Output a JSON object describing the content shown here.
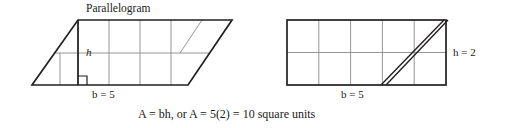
{
  "figure": {
    "title": "Parallelogram",
    "type": "geometry-diagram",
    "caption": "A = bh, or A = 5(2) = 10 square units",
    "colors": {
      "outline": "#231f20",
      "grid": "#808080",
      "background": "#ffffff",
      "text": "#1a1a1a"
    },
    "left_shape": {
      "name": "parallelogram",
      "base_label": "b = 5",
      "height_label": "h",
      "base_units": 5,
      "height_units": 2,
      "grid_columns": 5,
      "grid_rows": 2,
      "right_angle_marker": true,
      "vertices": [
        [
          32,
          85
        ],
        [
          188,
          85
        ],
        [
          232,
          20
        ],
        [
          78,
          20
        ]
      ]
    },
    "right_shape": {
      "name": "rectangle",
      "base_label": "b = 5",
      "height_label": "h = 2",
      "base_units": 5,
      "height_units": 2,
      "grid_columns": 5,
      "grid_rows": 2,
      "double_diagonal": true,
      "vertices": [
        [
          287,
          85
        ],
        [
          446,
          85
        ],
        [
          446,
          20
        ],
        [
          287,
          20
        ]
      ]
    },
    "formula": {
      "area_symbol": "A",
      "equals": "=",
      "base_symbol": "b",
      "height_symbol": "h",
      "or_text": ", or",
      "numeric": "5(2)",
      "result": "10 square units"
    }
  }
}
